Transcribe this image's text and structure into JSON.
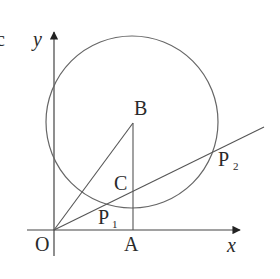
{
  "diagram": {
    "type": "geometry-coordinate-figure",
    "stroke_color": "#555555",
    "text_color": "#2a2a2a",
    "axes": {
      "x_label": "x",
      "y_label": "y",
      "origin_label": "O"
    },
    "points": {
      "O": {
        "label": "O"
      },
      "A": {
        "label": "A"
      },
      "B": {
        "label": "B"
      },
      "C": {
        "label": "C"
      },
      "P1": {
        "label": "P",
        "subscript": "1"
      },
      "P2": {
        "label": "P",
        "subscript": "2"
      }
    },
    "elements": [
      "circle centered at B",
      "segment OB",
      "segment BA (vertical, perpendicular to x-axis)",
      "ray from O through P1, C, P2"
    ]
  }
}
